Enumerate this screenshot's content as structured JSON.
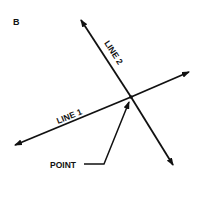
{
  "figure": {
    "panel_label": "B",
    "line1_label": "LINE 1",
    "line2_label": "LINE 2",
    "point_label": "POINT",
    "colors": {
      "ink": "#111111",
      "background": "#ffffff"
    }
  }
}
